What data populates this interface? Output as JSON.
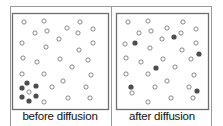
{
  "diagram": {
    "colors": {
      "frame": "#9a9a9a",
      "box": "#6e6e6e",
      "open_dot": "#7a7a7a",
      "filled_dot": "#4d4d4d",
      "text": "#111111"
    },
    "panels": [
      {
        "label": "before diffusion",
        "box": {
          "x": 12,
          "y": 13,
          "w": 96,
          "h": 96
        },
        "open_dots": [
          [
            24,
            22
          ],
          [
            44,
            21
          ],
          [
            35,
            33
          ],
          [
            47,
            31
          ],
          [
            22,
            43
          ],
          [
            46,
            47
          ],
          [
            59,
            39
          ],
          [
            23,
            58
          ],
          [
            80,
            22
          ],
          [
            67,
            28
          ],
          [
            78,
            33
          ],
          [
            93,
            29
          ],
          [
            93,
            43
          ],
          [
            79,
            50
          ],
          [
            88,
            60
          ],
          [
            37,
            62
          ],
          [
            60,
            59
          ],
          [
            22,
            74
          ],
          [
            44,
            74
          ],
          [
            29,
            92
          ],
          [
            52,
            87
          ],
          [
            44,
            102
          ],
          [
            72,
            67
          ],
          [
            91,
            75
          ],
          [
            63,
            81
          ],
          [
            86,
            87
          ],
          [
            68,
            98
          ],
          [
            90,
            98
          ]
        ],
        "filled_dots": [
          [
            27,
            83
          ],
          [
            36,
            86
          ],
          [
            22,
            88
          ],
          [
            22,
            97
          ],
          [
            36,
            96
          ],
          [
            29,
            101
          ]
        ]
      },
      {
        "label": "after diffusion",
        "box": {
          "x": 116,
          "y": 13,
          "w": 92,
          "h": 96
        },
        "open_dots": [
          [
            128,
            22
          ],
          [
            148,
            21
          ],
          [
            139,
            33
          ],
          [
            151,
            31
          ],
          [
            125,
            44
          ],
          [
            150,
            48
          ],
          [
            126,
            58
          ],
          [
            183,
            22
          ],
          [
            167,
            28
          ],
          [
            181,
            33
          ],
          [
            196,
            29
          ],
          [
            162,
            39
          ],
          [
            196,
            43
          ],
          [
            182,
            50
          ],
          [
            191,
            59
          ],
          [
            141,
            62
          ],
          [
            163,
            59
          ],
          [
            126,
            74
          ],
          [
            148,
            74
          ],
          [
            155,
            87
          ],
          [
            132,
            93
          ],
          [
            148,
            102
          ],
          [
            175,
            67
          ],
          [
            194,
            75
          ],
          [
            167,
            81
          ],
          [
            189,
            87
          ],
          [
            171,
            98
          ],
          [
            193,
            98
          ]
        ],
        "filled_dots": [
          [
            135,
            43
          ],
          [
            174,
            37
          ],
          [
            199,
            54
          ],
          [
            156,
            68
          ],
          [
            131,
            87
          ],
          [
            197,
            91
          ]
        ]
      }
    ]
  }
}
